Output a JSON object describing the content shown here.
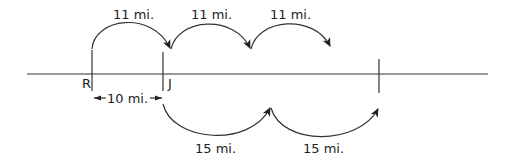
{
  "diagram": {
    "points": [
      {
        "label": "R",
        "x": 92
      },
      {
        "label": "J",
        "x": 163
      },
      {
        "label": "",
        "x": 379
      }
    ],
    "top_jumps": [
      {
        "label": "11 mi.",
        "from_x": 92,
        "to_x": 170
      },
      {
        "label": "11 mi.",
        "from_x": 170,
        "to_x": 250
      },
      {
        "label": "11 mi.",
        "from_x": 250,
        "to_x": 330
      }
    ],
    "bottom_jumps": [
      {
        "label": "15 mi.",
        "from_x": 163,
        "to_x": 270
      },
      {
        "label": "15 mi.",
        "from_x": 270,
        "to_x": 378
      }
    ],
    "distance_R_J": {
      "label": "10 mi."
    },
    "colors": {
      "line": "#333333",
      "text": "#222222"
    }
  }
}
